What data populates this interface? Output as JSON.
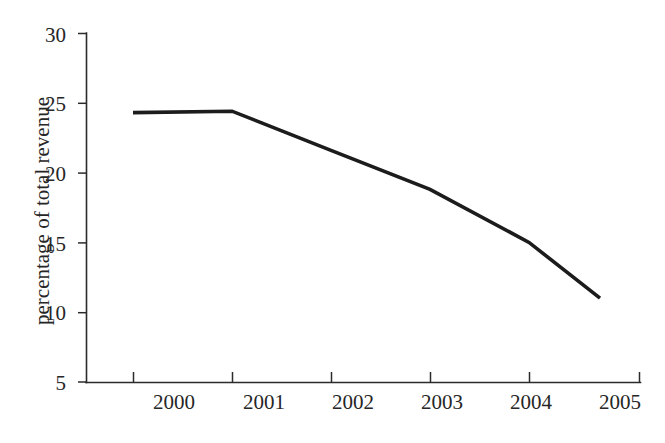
{
  "chart_data": {
    "type": "line",
    "title": "",
    "subtitle": "",
    "xlabel": "",
    "ylabel": "percentage of total revenue",
    "categories": [
      "2000",
      "2001",
      "2002",
      "2003",
      "2004",
      "2005"
    ],
    "x": [
      2000,
      2001,
      2002,
      2003,
      2004,
      2005
    ],
    "values": [
      24.3,
      24.4,
      21.6,
      18.8,
      15.0,
      11.0
    ],
    "series": [
      {
        "name": "percentage of total revenue",
        "values": [
          24.3,
          24.4,
          21.6,
          18.8,
          15.0,
          11.0
        ]
      }
    ],
    "yticks": [
      5,
      10,
      15,
      20,
      25,
      30
    ],
    "ytick_labels": [
      "5",
      "10",
      "15",
      "20",
      "25",
      "30"
    ],
    "xtick_labels": [
      "2000",
      "2001",
      "2002",
      "2003",
      "2004",
      "2005"
    ],
    "ylim": [
      5,
      30
    ],
    "xlim": [
      2000,
      2005
    ],
    "grid": false,
    "legend": false,
    "legend_position": "none",
    "line_color": "#1c1c1c",
    "axis_color": "#2b2b2b",
    "background_color": "#ffffff",
    "markers": false,
    "annotations": []
  },
  "axis": {
    "y_title": "percentage of total revenue",
    "y_labels": {
      "t30": "30",
      "t25": "25",
      "t20": "20",
      "t15": "15",
      "t10": "10",
      "t5": "5"
    },
    "x_labels": {
      "t2000": "2000",
      "t2001": "2001",
      "t2002": "2002",
      "t2003": "2003",
      "t2004": "2004",
      "t2005": "2005"
    }
  }
}
